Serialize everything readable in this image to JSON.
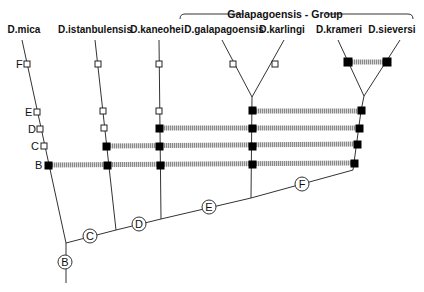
{
  "title": "Galapagoensis - Group",
  "species": [
    {
      "id": "mica",
      "label": "D.mica"
    },
    {
      "id": "istanbulensis",
      "label": "D.istanbulensis"
    },
    {
      "id": "kaneohei",
      "label": "D.kaneohei"
    },
    {
      "id": "galapagoensis",
      "label": "D.galapagoensis"
    },
    {
      "id": "karlingi",
      "label": "D.karlingi"
    },
    {
      "id": "krameri",
      "label": "D.krameri"
    },
    {
      "id": "sieversi",
      "label": "D.sieversi"
    }
  ],
  "stage_labels": [
    "F",
    "E",
    "D",
    "C",
    "B"
  ],
  "internal_nodes": [
    "B",
    "C",
    "D",
    "E",
    "F"
  ],
  "legend": {
    "open_square": "character state absent",
    "filled_square": "character state present",
    "hatched_bar": "shared character linkage"
  },
  "colors": {
    "line": "#333333",
    "filled_marker": "#000000",
    "hatch": "#9a9a9a"
  }
}
